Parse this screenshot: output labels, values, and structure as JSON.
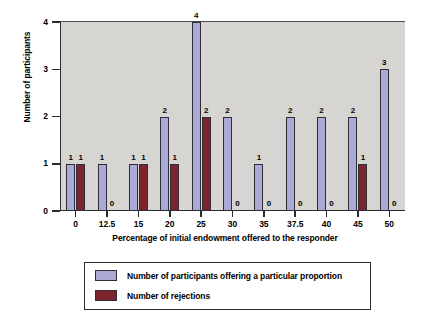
{
  "chart_data": {
    "type": "bar",
    "title": "",
    "xlabel": "Percentage of initial endowment offered to the responder",
    "ylabel": "Number of participants",
    "categories": [
      "0",
      "12.5",
      "15",
      "20",
      "25",
      "30",
      "35",
      "37.5",
      "40",
      "45",
      "50"
    ],
    "series": [
      {
        "name": "Number of participants offering a particular proportion",
        "color": "#aba9d6",
        "values": [
          1,
          1,
          1,
          2,
          4,
          2,
          1,
          2,
          2,
          2,
          3
        ]
      },
      {
        "name": "Number of rejections",
        "color": "#7c232c",
        "values": [
          1,
          0,
          1,
          1,
          2,
          0,
          0,
          0,
          0,
          1,
          0
        ]
      }
    ],
    "ylim": [
      0,
      4
    ],
    "yticks": [
      "0",
      "1",
      "2",
      "3",
      "4"
    ],
    "grid": false,
    "legend_position": "bottom",
    "data_labels": true,
    "plot_background": "#d6d5d2"
  },
  "legend": {
    "entries": [
      {
        "label": "Number of participants offering a particular proportion"
      },
      {
        "label": "Number of rejections"
      }
    ]
  }
}
